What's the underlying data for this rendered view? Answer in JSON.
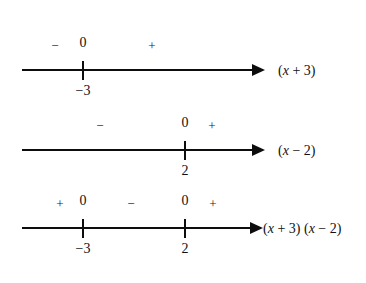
{
  "figure": {
    "background_color": "#ffffff",
    "ink_color": "#0d0d0d"
  },
  "number_lines": [
    {
      "id": "line-x-plus-3",
      "axis": {
        "y": 70,
        "x_start": 22,
        "x_end": 252,
        "arrow_tip_x": 265
      },
      "label": {
        "text": "(x + 3)",
        "var": "x",
        "rest_left": "(",
        "rest_right": " + 3)",
        "x": 278,
        "y": 64
      },
      "ticks": [
        {
          "x": 83,
          "zero": "0",
          "zero_y": 36,
          "root": "−3",
          "root_y": 84
        }
      ],
      "signs": [
        {
          "symbol": "−",
          "x": 55,
          "y": 39
        },
        {
          "symbol": "+",
          "x": 152,
          "y": 39
        }
      ]
    },
    {
      "id": "line-x-minus-2",
      "axis": {
        "y": 150,
        "x_start": 22,
        "x_end": 252,
        "arrow_tip_x": 265
      },
      "label": {
        "text": "(x − 2)",
        "var": "x",
        "rest_left": "(",
        "rest_right": " − 2)",
        "x": 278,
        "y": 144
      },
      "ticks": [
        {
          "x": 185,
          "zero": "0",
          "zero_y": 116,
          "root": "2",
          "root_y": 164
        }
      ],
      "signs": [
        {
          "symbol": "−",
          "x": 100,
          "y": 119
        },
        {
          "symbol": "+",
          "x": 212,
          "y": 119
        }
      ]
    },
    {
      "id": "line-product",
      "axis": {
        "y": 228,
        "x_start": 22,
        "x_end": 250,
        "arrow_tip_x": 263
      },
      "label": {
        "text": "(x + 3) (x − 2)",
        "x": 263,
        "y": 222
      },
      "ticks": [
        {
          "x": 83,
          "zero": "0",
          "zero_y": 194,
          "root": "−3",
          "root_y": 242
        },
        {
          "x": 185,
          "zero": "0",
          "zero_y": 194,
          "root": "2",
          "root_y": 242
        }
      ],
      "signs": [
        {
          "symbol": "+",
          "x": 60,
          "y": 197
        },
        {
          "symbol": "−",
          "x": 131,
          "y": 197
        },
        {
          "symbol": "+",
          "x": 213,
          "y": 197
        }
      ]
    }
  ],
  "product_label_parts": {
    "open1": "(",
    "var1": "x",
    "tail1": " + 3)",
    "space": " ",
    "open2": "(",
    "var2": "x",
    "tail2": " − 2)"
  }
}
